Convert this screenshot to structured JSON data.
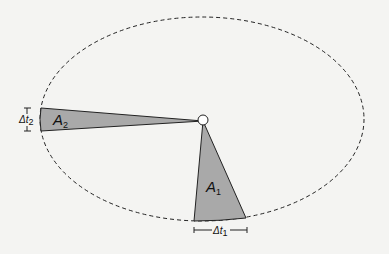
{
  "diagram": {
    "orbit": {
      "style": "dashed",
      "shape": "ellipse"
    },
    "focus": {
      "label": ""
    },
    "regions": [
      {
        "id": "A1",
        "label_main": "A",
        "label_sub": "1",
        "interval_main": "Δt",
        "interval_sub": "1"
      },
      {
        "id": "A2",
        "label_main": "A",
        "label_sub": "2",
        "interval_main": "Δt",
        "interval_sub": "2"
      }
    ],
    "colors": {
      "wedge_fill": "#a9a9a9",
      "stroke": "#222222",
      "background": "#f4f4f2"
    }
  }
}
